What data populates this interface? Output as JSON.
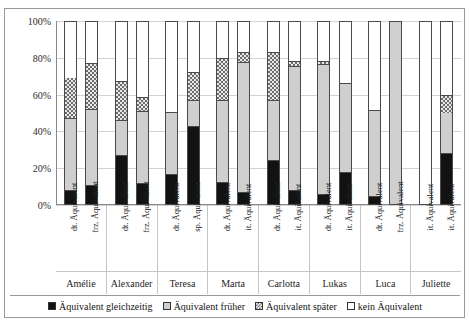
{
  "top_partial_text": "",
  "chart_data": {
    "type": "bar",
    "subtype": "stacked-100-percent",
    "title": "",
    "xlabel": "",
    "ylabel": "",
    "ylim": [
      0,
      100
    ],
    "ytick_labels": [
      "0%",
      "20%",
      "40%",
      "60%",
      "80%",
      "100%"
    ],
    "ytick_values": [
      0,
      20,
      40,
      60,
      80,
      100
    ],
    "grid": true,
    "legend_position": "bottom",
    "legend": [
      {
        "name": "Äquivalent gleichzeitig",
        "key": "gleichzeitig",
        "pattern": "solid-black",
        "color": "#121212"
      },
      {
        "name": "Äquivalent früher",
        "key": "frueher",
        "pattern": "solid-light-gray",
        "color": "#cfcfcf"
      },
      {
        "name": "Äquivalent später",
        "key": "spaeter",
        "pattern": "checkered",
        "color": "#6e6e6e"
      },
      {
        "name": "kein Äquivalent",
        "key": "kein",
        "pattern": "empty-white",
        "color": "#ffffff"
      }
    ],
    "series": [
      {
        "name": "Äquivalent gleichzeitig",
        "values": [
          7,
          10,
          27,
          11,
          16,
          43,
          12,
          6,
          24,
          7,
          5,
          17,
          4,
          0,
          0,
          28
        ]
      },
      {
        "name": "Äquivalent früher",
        "values": [
          40,
          42,
          19,
          40,
          34,
          14,
          45,
          72,
          33,
          69,
          72,
          49,
          47,
          100,
          0,
          22
        ]
      },
      {
        "name": "Äquivalent später",
        "values": [
          22,
          25,
          21,
          7,
          0,
          15,
          23,
          5,
          26,
          2,
          1,
          0,
          0,
          0,
          0,
          9
        ]
      },
      {
        "name": "kein Äquivalent",
        "values": [
          31,
          23,
          33,
          42,
          50,
          28,
          20,
          17,
          17,
          22,
          22,
          34,
          49,
          0,
          100,
          41
        ]
      }
    ],
    "categories": [
      "dt. Äquivalent",
      "frz. Äquivalent",
      "dt. Äquivalent",
      "frz. Äquivalent",
      "dt. Äquivalent",
      "sp. Äquivalent",
      "dt. Äquivalent",
      "it. Äquivalent",
      "dt. Äquivalent",
      "it. Äquivalent",
      "dt. Äquivalent",
      "it. Äquivalent",
      "dt. Äquivalent",
      "it. Äquivalent",
      "frz. Äquivalent",
      "it. Äquivalent"
    ],
    "groups": [
      {
        "name": "Amélie",
        "bars": [
          {
            "top": "dt.",
            "bottom": "Äquivalent",
            "gleichzeitig": 7,
            "frueher": 40,
            "spaeter": 22,
            "kein": 31
          },
          {
            "top": "frz.",
            "bottom": "Äquivalent",
            "gleichzeitig": 10,
            "frueher": 42,
            "spaeter": 25,
            "kein": 23
          }
        ]
      },
      {
        "name": "Alexander",
        "bars": [
          {
            "top": "dt.",
            "bottom": "Äquivalent",
            "gleichzeitig": 27,
            "frueher": 19,
            "spaeter": 21,
            "kein": 33
          },
          {
            "top": "frz.",
            "bottom": "Äquivalent",
            "gleichzeitig": 11,
            "frueher": 40,
            "spaeter": 7,
            "kein": 42
          }
        ]
      },
      {
        "name": "Teresa",
        "bars": [
          {
            "top": "dt.",
            "bottom": "Äquivalent",
            "gleichzeitig": 16,
            "frueher": 34,
            "spaeter": 0,
            "kein": 50
          },
          {
            "top": "sp.",
            "bottom": "Äquivalent",
            "gleichzeitig": 43,
            "frueher": 14,
            "spaeter": 15,
            "kein": 28
          }
        ]
      },
      {
        "name": "Marta",
        "bars": [
          {
            "top": "dt.",
            "bottom": "Äquivalent",
            "gleichzeitig": 12,
            "frueher": 45,
            "spaeter": 23,
            "kein": 20
          },
          {
            "top": "it.",
            "bottom": "Äquivalent",
            "gleichzeitig": 6,
            "frueher": 72,
            "spaeter": 5,
            "kein": 17
          }
        ]
      },
      {
        "name": "Carlotta",
        "bars": [
          {
            "top": "dt.",
            "bottom": "Äquivalent",
            "gleichzeitig": 24,
            "frueher": 33,
            "spaeter": 26,
            "kein": 17
          },
          {
            "top": "it.",
            "bottom": "Äquivalent",
            "gleichzeitig": 7,
            "frueher": 69,
            "spaeter": 2,
            "kein": 22
          }
        ]
      },
      {
        "name": "Lukas",
        "bars": [
          {
            "top": "dt.",
            "bottom": "Äquivalent",
            "gleichzeitig": 5,
            "frueher": 72,
            "spaeter": 1,
            "kein": 22
          },
          {
            "top": "it.",
            "bottom": "Äquivalent",
            "gleichzeitig": 17,
            "frueher": 49,
            "spaeter": 0,
            "kein": 34
          }
        ]
      },
      {
        "name": "Luca",
        "bars": [
          {
            "top": "dt.",
            "bottom": "Äquivalent",
            "gleichzeitig": 4,
            "frueher": 47,
            "spaeter": 0,
            "kein": 49
          },
          {
            "top": "frz.",
            "bottom": "Äquivalent",
            "gleichzeitig": 0,
            "frueher": 100,
            "spaeter": 0,
            "kein": 0
          }
        ]
      },
      {
        "name": "Juliette",
        "bars": [
          {
            "top": "it.",
            "bottom": "Äquivalent",
            "gleichzeitig": 0,
            "frueher": 0,
            "spaeter": 0,
            "kein": 100
          },
          {
            "top": "it.",
            "bottom": "Äquivalent",
            "gleichzeitig": 28,
            "frueher": 22,
            "spaeter": 9,
            "kein": 41
          }
        ]
      }
    ]
  }
}
